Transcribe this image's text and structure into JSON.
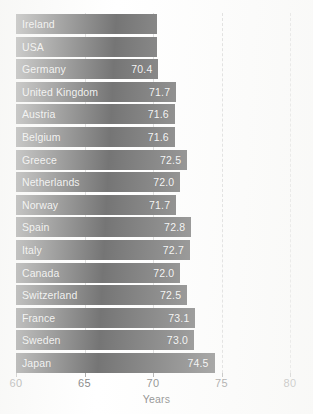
{
  "chart_data": {
    "type": "bar",
    "orientation": "horizontal",
    "title": "",
    "xlabel": "Years",
    "ylabel": "",
    "xlim": [
      60,
      80
    ],
    "xticks": [
      60,
      65,
      70,
      75,
      80
    ],
    "xtick_labels": [
      "60",
      "65",
      "70",
      "75",
      "80"
    ],
    "grid": true,
    "gridlines_at": [
      75,
      80
    ],
    "legend": "none",
    "bar_color": "#474747",
    "label_color": "#ededed",
    "categories": [
      "Ireland",
      "USA",
      "Germany",
      "United Kingdom",
      "Austria",
      "Belgium",
      "Greece",
      "Netherlands",
      "Norway",
      "Spain",
      "Italy",
      "Canada",
      "Switzerland",
      "France",
      "Sweden",
      "Japan"
    ],
    "values": [
      70.3,
      70.3,
      70.4,
      71.7,
      71.6,
      71.6,
      72.5,
      72.0,
      71.7,
      72.8,
      72.7,
      72.0,
      72.5,
      73.1,
      73.0,
      74.5
    ],
    "value_labels": [
      "",
      "",
      "70.4",
      "71.7",
      "71.6",
      "71.6",
      "72.5",
      "72.0",
      "71.7",
      "72.8",
      "72.7",
      "72.0",
      "72.5",
      "73.1",
      "73.0",
      "74.5"
    ]
  }
}
